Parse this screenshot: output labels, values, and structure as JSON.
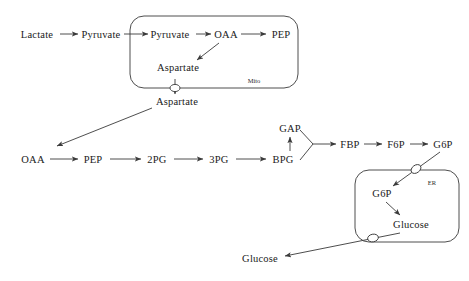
{
  "diagram": {
    "stroke_color": "#3a3a3a",
    "text_color": "#1a1a1a",
    "background": "#ffffff",
    "compartments": [
      {
        "id": "mito",
        "label": "Mito",
        "label_x": 254,
        "label_y": 80,
        "x": 130,
        "y": 16,
        "w": 168,
        "h": 72,
        "r": 14
      },
      {
        "id": "er",
        "label": "ER",
        "label_x": 432,
        "label_y": 182,
        "x": 355,
        "y": 170,
        "w": 104,
        "h": 72,
        "r": 14
      }
    ],
    "nodes": [
      {
        "id": "lactate",
        "label": "Lactate",
        "x": 37,
        "y": 34
      },
      {
        "id": "pyruvate_cyt",
        "label": "Pyruvate",
        "x": 101,
        "y": 34
      },
      {
        "id": "pyruvate_mito",
        "label": "Pyruvate",
        "x": 170,
        "y": 34
      },
      {
        "id": "oaa_mito",
        "label": "OAA",
        "x": 226,
        "y": 34
      },
      {
        "id": "pep_mito",
        "label": "PEP",
        "x": 281,
        "y": 34
      },
      {
        "id": "aspartate_mito",
        "label": "Aspartate",
        "x": 178,
        "y": 67
      },
      {
        "id": "aspartate_cyt",
        "label": "Aspartate",
        "x": 177,
        "y": 101
      },
      {
        "id": "oaa_cyt",
        "label": "OAA",
        "x": 33,
        "y": 159
      },
      {
        "id": "pep_cyt",
        "label": "PEP",
        "x": 93,
        "y": 159
      },
      {
        "id": "pg2",
        "label": "2PG",
        "x": 157,
        "y": 159
      },
      {
        "id": "pg3",
        "label": "3PG",
        "x": 219,
        "y": 159
      },
      {
        "id": "bpg",
        "label": "BPG",
        "x": 283,
        "y": 159
      },
      {
        "id": "gap",
        "label": "GAP",
        "x": 290,
        "y": 128
      },
      {
        "id": "fbp",
        "label": "FBP",
        "x": 350,
        "y": 144
      },
      {
        "id": "f6p",
        "label": "F6P",
        "x": 396,
        "y": 144
      },
      {
        "id": "g6p_cyt",
        "label": "G6P",
        "x": 443,
        "y": 144
      },
      {
        "id": "g6p_er",
        "label": "G6P",
        "x": 382,
        "y": 193
      },
      {
        "id": "glucose_er",
        "label": "Glucose",
        "x": 411,
        "y": 224
      },
      {
        "id": "glucose_out",
        "label": "Glucose",
        "x": 260,
        "y": 258
      }
    ],
    "transporters": [
      {
        "id": "aspartate-transporter",
        "cx": 175,
        "cy": 88
      },
      {
        "id": "g6p-transporter",
        "cx": 416,
        "cy": 174
      },
      {
        "id": "glucose-transporter",
        "cx": 373,
        "cy": 240
      }
    ],
    "edges": [
      {
        "id": "lactate-to-pyruvate",
        "from": "Lactate",
        "to": "Pyruvate"
      },
      {
        "id": "pyruvate-into-mito",
        "from": "Pyruvate",
        "to": "Pyruvate"
      },
      {
        "id": "pyruvate-to-oaa",
        "from": "Pyruvate",
        "to": "OAA"
      },
      {
        "id": "oaa-to-pep-mito",
        "from": "OAA",
        "to": "PEP"
      },
      {
        "id": "oaa-to-aspartate",
        "from": "OAA",
        "to": "Aspartate"
      },
      {
        "id": "aspartate-out-of-mito",
        "from": "Aspartate",
        "to": "Aspartate"
      },
      {
        "id": "aspartate-to-oaa-cyt",
        "from": "Aspartate",
        "to": "OAA"
      },
      {
        "id": "oaa-to-pep-cyt",
        "from": "OAA",
        "to": "PEP"
      },
      {
        "id": "pep-to-2pg",
        "from": "PEP",
        "to": "2PG"
      },
      {
        "id": "2pg-to-3pg",
        "from": "2PG",
        "to": "3PG"
      },
      {
        "id": "3pg-to-bpg",
        "from": "3PG",
        "to": "BPG"
      },
      {
        "id": "bpg-to-gap",
        "from": "BPG",
        "to": "GAP"
      },
      {
        "id": "gap-bpg-to-fbp",
        "from": "GAP + BPG",
        "to": "FBP"
      },
      {
        "id": "fbp-to-f6p",
        "from": "FBP",
        "to": "F6P"
      },
      {
        "id": "f6p-to-g6p",
        "from": "F6P",
        "to": "G6P"
      },
      {
        "id": "g6p-into-er",
        "from": "G6P",
        "to": "G6P"
      },
      {
        "id": "g6p-to-glucose-er",
        "from": "G6P",
        "to": "Glucose"
      },
      {
        "id": "glucose-out-of-er",
        "from": "Glucose",
        "to": "Glucose"
      }
    ]
  }
}
